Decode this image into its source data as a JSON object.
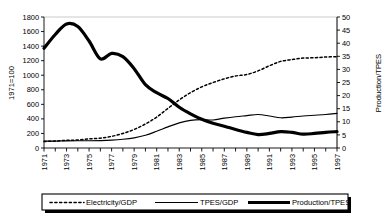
{
  "chart_data": {
    "type": "line",
    "title": "",
    "xlabel": "",
    "ylabel": "1971=100",
    "y2label": "Production/TPES",
    "ylim": [
      0,
      1800
    ],
    "y2lim": [
      0,
      50
    ],
    "ytick_step": 200,
    "y2tick_step": 5,
    "grid": false,
    "legend_position": "bottom",
    "yticks": [
      "0",
      "200",
      "400",
      "600",
      "800",
      "1000",
      "1200",
      "1400",
      "1600",
      "1800"
    ],
    "y2ticks": [
      "0",
      "5",
      "10",
      "15",
      "20",
      "25",
      "30",
      "35",
      "40",
      "45",
      "50"
    ],
    "x": [
      1971,
      1972,
      1973,
      1974,
      1975,
      1976,
      1977,
      1978,
      1979,
      1980,
      1981,
      1982,
      1983,
      1984,
      1985,
      1986,
      1987,
      1988,
      1989,
      1990,
      1991,
      1992,
      1993,
      1994,
      1995,
      1996,
      1997
    ],
    "xtick_labels": [
      "1971",
      "1973",
      "1975",
      "1977",
      "1979",
      "1981",
      "1983",
      "1985",
      "1987",
      "1989",
      "1991",
      "1993",
      "1995",
      "1997"
    ],
    "series": [
      {
        "name": "Electricity/GDP",
        "style": "dashed",
        "axis": "left",
        "values": [
          90,
          95,
          105,
          110,
          125,
          135,
          160,
          200,
          255,
          330,
          425,
          545,
          660,
          760,
          840,
          900,
          950,
          990,
          1010,
          1060,
          1130,
          1190,
          1215,
          1235,
          1240,
          1250,
          1255
        ]
      },
      {
        "name": "TPES/GDP",
        "style": "solid-thin",
        "axis": "left",
        "values": [
          95,
          95,
          98,
          100,
          100,
          102,
          108,
          120,
          140,
          175,
          230,
          290,
          345,
          380,
          390,
          385,
          410,
          430,
          445,
          460,
          440,
          415,
          425,
          440,
          450,
          460,
          475
        ]
      },
      {
        "name": "Production/TPES",
        "style": "solid-thick",
        "axis": "left",
        "values": [
          1370,
          1560,
          1705,
          1670,
          1470,
          1225,
          1300,
          1255,
          1090,
          870,
          760,
          680,
          560,
          470,
          395,
          340,
          300,
          255,
          215,
          185,
          200,
          225,
          215,
          190,
          200,
          215,
          225
        ]
      }
    ],
    "series_right_axis_note": {
      "Electricity/GDP": "plotted against left axis (1971=100)",
      "TPES/GDP": "plotted against left axis (1971=100)",
      "Production/TPES": "plotted against left axis (1971=100)"
    },
    "legend": [
      {
        "label": "Electricity/GDP",
        "style": "dashed"
      },
      {
        "label": "TPES/GDP",
        "style": "solid-thin"
      },
      {
        "label": "Production/TPES",
        "style": "solid-thick"
      }
    ]
  },
  "colors": {
    "line": "#000000",
    "axis": "#000000",
    "border": "#b9b9b9",
    "background": "#ffffff",
    "legend_shadow": "#000000"
  }
}
